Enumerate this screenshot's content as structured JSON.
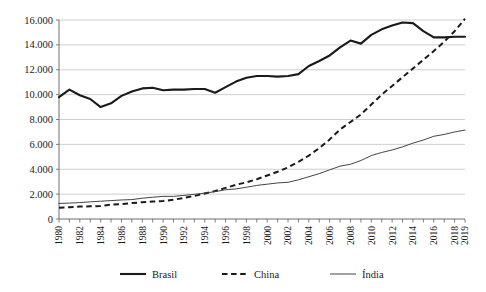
{
  "chart_data": {
    "type": "line",
    "title": "",
    "xlabel": "",
    "ylabel": "",
    "grid": "horizontal",
    "legend_position": "bottom",
    "ylim": [
      0,
      16000
    ],
    "ytick_step": 2000,
    "ytick_labels": [
      "0",
      "2.000",
      "4.000",
      "6.000",
      "8.000",
      "10.000",
      "12.000",
      "14.000",
      "16.000"
    ],
    "ytick_values": [
      0,
      2000,
      4000,
      6000,
      8000,
      10000,
      12000,
      14000,
      16000
    ],
    "x": [
      1980,
      1981,
      1982,
      1983,
      1984,
      1985,
      1986,
      1987,
      1988,
      1989,
      1990,
      1991,
      1992,
      1993,
      1994,
      1995,
      1996,
      1997,
      1998,
      1999,
      2000,
      2001,
      2002,
      2003,
      2004,
      2005,
      2006,
      2007,
      2008,
      2009,
      2010,
      2011,
      2012,
      2013,
      2014,
      2015,
      2016,
      2017,
      2018,
      2019
    ],
    "xtick_labels": [
      "1980",
      "",
      "1982",
      "",
      "1984",
      "",
      "1986",
      "",
      "1988",
      "",
      "1990",
      "",
      "1992",
      "",
      "1994",
      "",
      "1996",
      "",
      "1998",
      "",
      "2000",
      "",
      "2002",
      "",
      "2004",
      "",
      "2006",
      "",
      "2008",
      "",
      "2010",
      "",
      "2012",
      "",
      "2014",
      "",
      "2016",
      "",
      "2018",
      "2019"
    ],
    "series": [
      {
        "name": "Brasil",
        "style": "solid-thick",
        "values": [
          9800,
          10400,
          9950,
          9650,
          9000,
          9300,
          9900,
          10250,
          10500,
          10550,
          10350,
          10400,
          10400,
          10450,
          10450,
          10150,
          10600,
          11050,
          11350,
          11500,
          11500,
          11450,
          11500,
          11650,
          12300,
          12700,
          13150,
          13800,
          14350,
          14100,
          14800,
          15250,
          15550,
          15800,
          15750,
          15100,
          14600,
          14600,
          14650,
          14650
        ]
      },
      {
        "name": "China",
        "style": "dashed",
        "values": [
          900,
          950,
          1000,
          1020,
          1050,
          1150,
          1200,
          1280,
          1350,
          1400,
          1450,
          1550,
          1700,
          1850,
          2050,
          2250,
          2500,
          2750,
          2950,
          3200,
          3500,
          3800,
          4150,
          4600,
          5100,
          5700,
          6400,
          7200,
          7800,
          8400,
          9200,
          10000,
          10700,
          11400,
          12100,
          12800,
          13500,
          14250,
          15100,
          16100
        ]
      },
      {
        "name": "Índia",
        "style": "solid-thin",
        "values": [
          1250,
          1280,
          1320,
          1380,
          1430,
          1480,
          1530,
          1560,
          1670,
          1750,
          1820,
          1820,
          1900,
          1980,
          2080,
          2200,
          2350,
          2420,
          2550,
          2700,
          2800,
          2900,
          2950,
          3150,
          3400,
          3650,
          3950,
          4250,
          4400,
          4700,
          5100,
          5350,
          5550,
          5800,
          6100,
          6350,
          6650,
          6800,
          7000,
          7150
        ]
      }
    ]
  },
  "legend": {
    "items": [
      {
        "label": "Brasil",
        "marker": "solid-thick"
      },
      {
        "label": "China",
        "marker": "dashed"
      },
      {
        "label": "Índia",
        "marker": "solid-thin"
      }
    ]
  }
}
